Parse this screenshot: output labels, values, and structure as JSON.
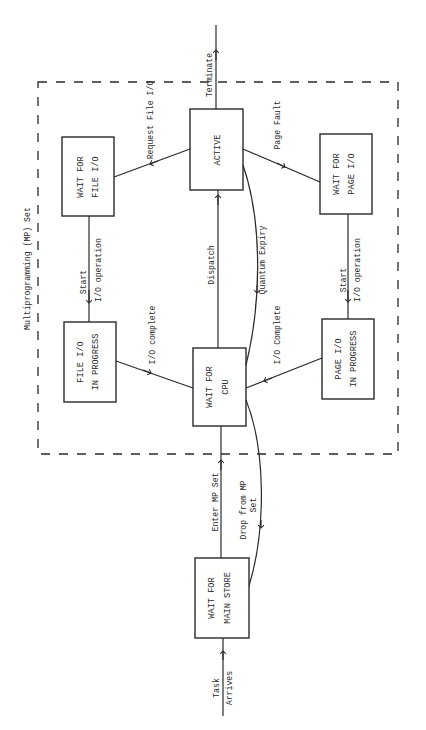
{
  "diagram": {
    "title": "Multiprogramming (MP) Set",
    "colors": {
      "ink": "#2a2a2a",
      "background": "#ffffff"
    },
    "states": [
      {
        "id": "active",
        "lines": [
          "ACTIVE"
        ]
      },
      {
        "id": "wait_file_io",
        "lines": [
          "WAIT FOR",
          "FILE I/O"
        ]
      },
      {
        "id": "file_io_in_progress",
        "lines": [
          "FILE I/O",
          "IN PROGRESS"
        ]
      },
      {
        "id": "wait_cpu",
        "lines": [
          "WAIT FOR",
          "CPU"
        ]
      },
      {
        "id": "wait_page_io",
        "lines": [
          "WAIT FOR",
          "PAGE I/O"
        ]
      },
      {
        "id": "page_io_in_progress",
        "lines": [
          "PAGE I/O",
          "IN PROGRESS"
        ]
      },
      {
        "id": "wait_main_store",
        "lines": [
          "WAIT FOR",
          "MAIN STORE"
        ]
      }
    ],
    "transitions": [
      {
        "from": "active",
        "to": "exit",
        "label": "Terminate"
      },
      {
        "from": "active",
        "to": "wait_file_io",
        "label": "Request File I/O"
      },
      {
        "from": "active",
        "to": "wait_page_io",
        "label": "Page Fault"
      },
      {
        "from": "wait_file_io",
        "to": "file_io_in_progress",
        "label_lines": [
          "Start",
          "I/O operation"
        ]
      },
      {
        "from": "wait_page_io",
        "to": "page_io_in_progress",
        "label_lines": [
          "Start",
          "I/O operation"
        ]
      },
      {
        "from": "file_io_in_progress",
        "to": "wait_cpu",
        "label": "I/O complete"
      },
      {
        "from": "page_io_in_progress",
        "to": "wait_cpu",
        "label": "I/O Complete"
      },
      {
        "from": "wait_cpu",
        "to": "active",
        "label": "Dispatch"
      },
      {
        "from": "active",
        "to": "wait_cpu",
        "label": "Quantum Expiry"
      },
      {
        "from": "wait_main_store",
        "to": "wait_cpu",
        "label": "Enter MP Set"
      },
      {
        "from": "wait_cpu",
        "to": "wait_main_store",
        "label_lines": [
          "Drop from MP",
          "Set"
        ]
      },
      {
        "from": "entry",
        "to": "wait_main_store",
        "label_lines": [
          "Task",
          "Arrives"
        ]
      }
    ]
  }
}
